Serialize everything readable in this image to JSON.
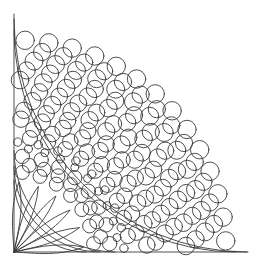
{
  "figure": {
    "type": "geometric-line-art",
    "canvas": {
      "width": 261,
      "height": 267
    },
    "background_color": "#ffffff",
    "stroke_color": "#3a3a3a",
    "stroke_width": 0.9,
    "origin": {
      "x": 14,
      "y": 252
    },
    "frame": {
      "left_edge_x": 14,
      "bottom_edge_y": 252,
      "top_y": 14,
      "right_x": 248
    },
    "arcs": [
      {
        "name": "outer-boundary-arc",
        "radius": 233
      },
      {
        "name": "outer-inner-arc",
        "radius": 222
      },
      {
        "name": "mid-ring-outer-arc",
        "radius": 101
      },
      {
        "name": "mid-ring-inner-arc",
        "radius": 86
      },
      {
        "name": "core-arc",
        "radius": 72
      }
    ],
    "petals": {
      "count": 6,
      "tip_radius": 70,
      "start_angle_deg": 4,
      "end_angle_deg": 86,
      "half_width_deg": 6
    },
    "circle_rings": [
      {
        "name": "ring-outer-a",
        "radius": 212,
        "count": 14,
        "circle_radius": 9.2,
        "phase_deg": 3
      },
      {
        "name": "ring-outer-b",
        "radius": 192,
        "count": 13,
        "circle_radius": 9.0,
        "phase_deg": 6
      },
      {
        "name": "ring-outer-c",
        "radius": 172,
        "count": 12,
        "circle_radius": 8.8,
        "phase_deg": 2
      },
      {
        "name": "ring-outer-d",
        "radius": 152,
        "count": 11,
        "circle_radius": 8.6,
        "phase_deg": 7
      },
      {
        "name": "ring-mid-a",
        "radius": 133,
        "count": 10,
        "circle_radius": 8.2,
        "phase_deg": 3
      },
      {
        "name": "ring-mid-b",
        "radius": 115,
        "count": 9,
        "circle_radius": 7.6,
        "phase_deg": 8
      },
      {
        "name": "ring-small",
        "radius": 110,
        "count": 9,
        "circle_radius": 4.2,
        "phase_deg": 2
      },
      {
        "name": "ring-inner-a",
        "radius": 96,
        "count": 8,
        "circle_radius": 7.2,
        "phase_deg": 5
      },
      {
        "name": "ring-core",
        "radius": 80,
        "count": 7,
        "circle_radius": 7.0,
        "phase_deg": 6
      }
    ],
    "labels": {
      "alt_text": "Quarter-circle rosette pattern of concentric rings of circles with radiating petals"
    }
  }
}
